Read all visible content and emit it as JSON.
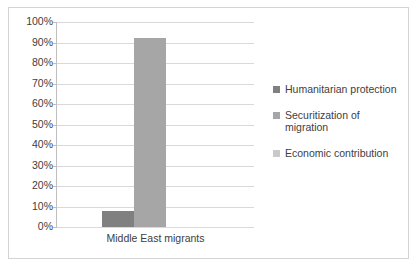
{
  "chart_data": {
    "type": "bar",
    "title": "",
    "subtitle": "",
    "xlabel": "",
    "ylabel": "",
    "categories": [
      "Middle East migrants"
    ],
    "series": [
      {
        "name": "Humanitarian protection",
        "values": [
          8
        ],
        "color": "#808080"
      },
      {
        "name": "Securitization of migration",
        "values": [
          92
        ],
        "color": "#a6a6a6"
      },
      {
        "name": "Economic contribution",
        "values": [
          0
        ],
        "color": "#c9c9c9"
      }
    ],
    "ylim": [
      0,
      100
    ],
    "ytick_labels": [
      "100%",
      "90%",
      "80%",
      "70%",
      "60%",
      "50%",
      "40%",
      "30%",
      "20%",
      "10%",
      "0%"
    ],
    "ytick_values": [
      100,
      90,
      80,
      70,
      60,
      50,
      40,
      30,
      20,
      10,
      0
    ],
    "value_suffix": "%",
    "grid": true,
    "grid_orientation": "horizontal",
    "legend_position": "right",
    "legend_entries": [
      "Humanitarian protection",
      "Securitization of migration",
      "Economic contribution"
    ],
    "plot_background": "#ffffff",
    "grid_color": "#d9d9d9",
    "axis_color": "#bfbfbf",
    "border_color": "#d4d4d4",
    "text_color": "#404040"
  }
}
